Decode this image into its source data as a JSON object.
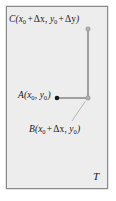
{
  "figure": {
    "caption_region_label": "T",
    "background_color": "#ededed",
    "border_color": "#8a8a8a",
    "line_color": "#8c8c8c",
    "point_fill_color": "#1a1a1a",
    "point_open_color": "#a8a8a8"
  },
  "labels": {
    "point_c": {
      "name": "C",
      "open_paren": "(",
      "x_var": "x",
      "x_sub": "0",
      "plus_1": "+",
      "dx": "Δx",
      "comma": ",",
      "y_var": "y",
      "y_sub": "0",
      "plus_2": "+",
      "dy": "Δy",
      "close_paren": ")",
      "full_text": "C(x0 + Δx, y0 + Δy)"
    },
    "point_a": {
      "name": "A",
      "open_paren": "(",
      "x_var": "x",
      "x_sub": "0",
      "comma": ",",
      "y_var": "y",
      "y_sub": "0",
      "close_paren": ")",
      "full_text": "A(x0, y0)"
    },
    "point_b": {
      "name": "B",
      "open_paren": "(",
      "x_var": "x",
      "x_sub": "0",
      "plus_1": "+",
      "dx": "Δx",
      "comma": ",",
      "y_var": "y",
      "y_sub": "0",
      "close_paren": ")",
      "full_text": "B(x0 + Δx, y0)"
    },
    "region": "T"
  },
  "geometry": {
    "point_a": {
      "x": 57,
      "y": 98
    },
    "point_b": {
      "x": 88,
      "y": 98
    },
    "point_c": {
      "x": 88,
      "y": 29
    },
    "segment_ab": "horizontal",
    "segment_bc": "vertical",
    "leader_line_b": {
      "x1": 85,
      "y1": 101,
      "x2": 72,
      "y2": 121
    }
  }
}
